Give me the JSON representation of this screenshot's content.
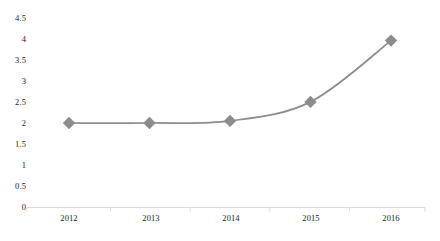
{
  "chart_data": {
    "type": "line",
    "title": "",
    "subtitle": "",
    "xlabel": "",
    "ylabel": "",
    "categories": [
      "2012",
      "2013",
      "2014",
      "2015",
      "2016"
    ],
    "values": [
      2,
      2,
      2.05,
      2.5,
      3.95
    ],
    "series": [
      {
        "name": "",
        "values": [
          2,
          2,
          2.05,
          2.5,
          3.95
        ],
        "color": "#8c8c8c",
        "marker": "diamond",
        "smooth": true
      }
    ],
    "ylim": [
      0,
      4.5
    ],
    "ytick_step": 0.5,
    "ytick_labels": [
      "4.5",
      "4",
      "3.5",
      "3",
      "2.5",
      "2",
      "1.5",
      "1",
      "0.5",
      "0"
    ],
    "ytick_values": [
      4.5,
      4,
      3.5,
      3,
      2.5,
      2,
      1.5,
      1,
      0.5,
      0
    ],
    "xtick_labels": [
      "2012",
      "2013",
      "2014",
      "2015",
      "2016"
    ],
    "grid": false,
    "legend": false,
    "legend_position": "none",
    "annotations": [],
    "colors": {
      "series_line": "#8c8c8c",
      "marker_fill": "#8c8c8c",
      "axis_line": "#d9d9d9",
      "tick_label": "#1a1a1a",
      "background": "#ffffff"
    }
  }
}
